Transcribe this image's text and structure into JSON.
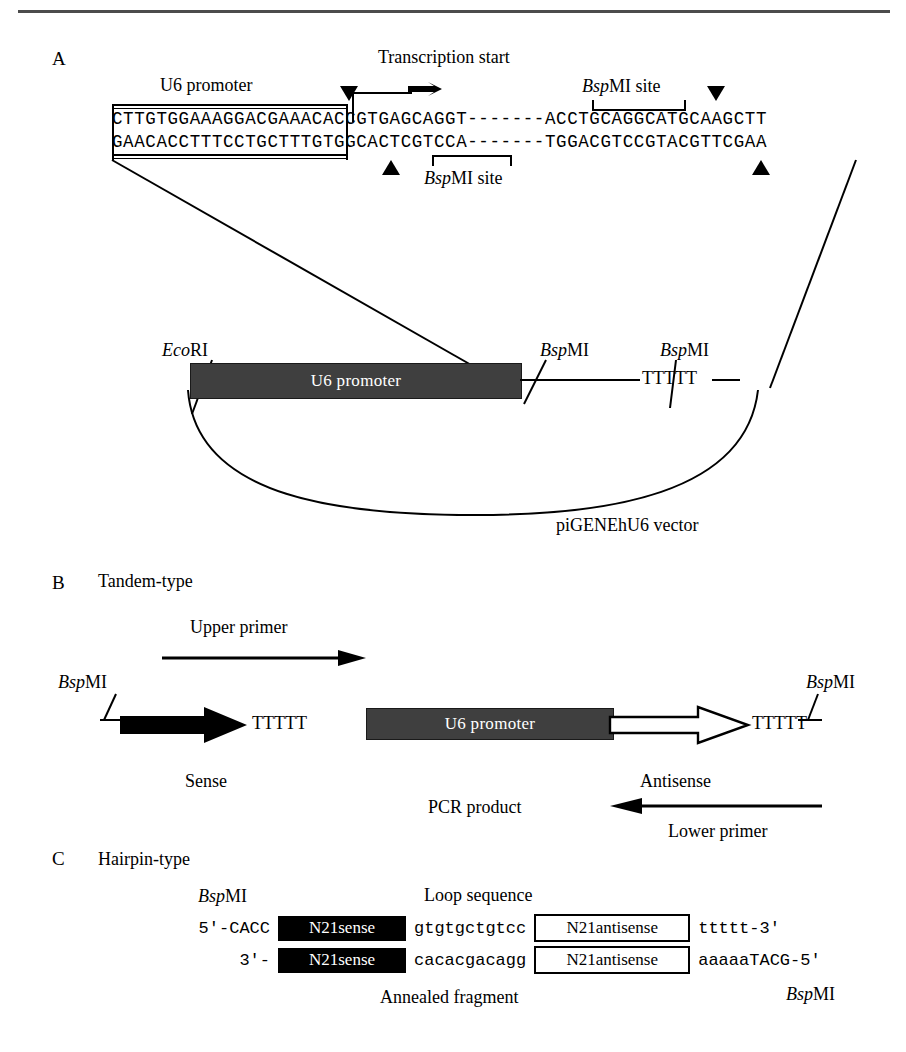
{
  "figure": {
    "panels": [
      "A",
      "B",
      "C"
    ]
  },
  "panelA": {
    "letter": "A",
    "transcription_start_label": "Transcription start",
    "u6_promoter_label": "U6 promoter",
    "bspmi_site_top_label_prefix": "Bsp",
    "bspmi_site_top_label_suffix": "MI site",
    "bspmi_site_bottom_label_prefix": "Bsp",
    "bspmi_site_bottom_label_suffix": "MI site",
    "sequence_top": "CTTGTGGAAAGGACGAAACACCGTGAGCAGGT-------ACCTGCAGGCATGCAAGCTT",
    "sequence_bottom": "GAACACCTTTCCTGCTTTGTGGCACTCGTCCA-------TGGACGTCCGTACGTTCGAA",
    "vector": {
      "ecori_prefix": "Eco",
      "ecori_suffix": "RI",
      "bspmi_left_prefix": "Bsp",
      "bspmi_left_suffix": "MI",
      "bspmi_right_prefix": "Bsp",
      "bspmi_right_suffix": "MI",
      "u6_promoter_label": "U6 promoter",
      "terminator": "TTTTT",
      "vector_name": "piGENEhU6 vector"
    }
  },
  "panelB": {
    "letter": "B",
    "title": "Tandem-type",
    "upper_primer_label": "Upper primer",
    "lower_primer_label": "Lower primer",
    "bspmi_left_prefix": "Bsp",
    "bspmi_left_suffix": "MI",
    "bspmi_right_prefix": "Bsp",
    "bspmi_right_suffix": "MI",
    "sense_label": "Sense",
    "antisense_label": "Antisense",
    "terminator_left": "TTTTT",
    "terminator_right": "TTTTT",
    "u6_promoter_label": "U6 promoter",
    "pcr_product_label": "PCR product"
  },
  "panelC": {
    "letter": "C",
    "title": "Hairpin-type",
    "bspmi_top_prefix": "Bsp",
    "bspmi_top_suffix": "MI",
    "bspmi_bottom_prefix": "Bsp",
    "bspmi_bottom_suffix": "MI",
    "loop_sequence_label": "Loop sequence",
    "annealed_fragment_label": "Annealed fragment",
    "top_strand": {
      "five_prime": "5′-CACC",
      "sense_box": "N21sense",
      "loop": "gtgtgctgtcc",
      "antisense_box": "N21antisense",
      "tail": "ttttt-3′"
    },
    "bottom_strand": {
      "three_prime": "3′-",
      "sense_box": "N21sense",
      "loop": "cacacgacagg",
      "antisense_box": "N21antisense",
      "tail": "aaaaaTACG-5′"
    }
  },
  "colors": {
    "promoter_gray": "#3f3f3f",
    "sense_black": "#000000",
    "line": "#000000",
    "rule_gray": "#4c4c4c"
  }
}
